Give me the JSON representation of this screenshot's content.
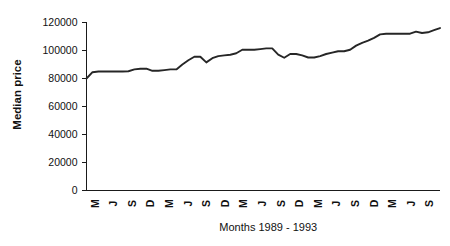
{
  "chart_data": {
    "type": "line",
    "title": "",
    "xlabel": "Months 1989 - 1993",
    "ylabel": "Median price",
    "ylim": [
      0,
      120000
    ],
    "ytick_labels": [
      "0",
      "20000",
      "40000",
      "60000",
      "80000",
      "100000",
      "120000"
    ],
    "ytick_values": [
      0,
      20000,
      40000,
      60000,
      80000,
      100000,
      120000
    ],
    "xtick_labels": [
      "M",
      "J",
      "S",
      "D",
      "M",
      "J",
      "S",
      "D",
      "M",
      "J",
      "S",
      "D",
      "M",
      "J",
      "S",
      "D",
      "M",
      "J",
      "S"
    ],
    "grid": false,
    "legend": null,
    "series": [
      {
        "name": "Median price",
        "color": "#262626",
        "values": [
          80000,
          84500,
          85000,
          85000,
          85000,
          85000,
          85000,
          85200,
          86500,
          87000,
          87000,
          85500,
          85500,
          86000,
          86500,
          86500,
          90000,
          93000,
          95500,
          95500,
          91500,
          94500,
          96000,
          96500,
          97000,
          98000,
          100500,
          100500,
          100500,
          101000,
          101500,
          101500,
          97000,
          94800,
          97500,
          97500,
          96500,
          95000,
          95000,
          96000,
          97500,
          98500,
          99500,
          99500,
          100500,
          103500,
          105500,
          107000,
          109000,
          111500,
          112000,
          112000,
          112000,
          112000,
          112000,
          113500,
          112500,
          113000,
          114500,
          116000
        ]
      }
    ]
  }
}
